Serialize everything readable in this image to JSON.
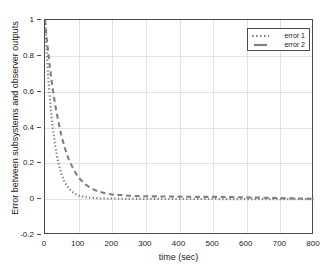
{
  "chart_data": {
    "type": "line",
    "title": "",
    "xlabel": "time (sec)",
    "ylabel": "Error between subsystems and observer outputs",
    "xlim": [
      0,
      800
    ],
    "ylim": [
      -0.2,
      1.0
    ],
    "xticks": [
      0,
      100,
      200,
      300,
      400,
      500,
      600,
      700,
      800
    ],
    "yticks": [
      -0.2,
      0,
      0.2,
      0.4,
      0.6,
      0.8,
      1
    ],
    "xticklabels": [
      "0",
      "100",
      "200",
      "300",
      "400",
      "500",
      "600",
      "700",
      "800"
    ],
    "yticklabels": [
      "-0.2",
      "0",
      "0.2",
      "0.4",
      "0.6",
      "0.8",
      "1"
    ],
    "grid": true,
    "legend_position": "upper right",
    "series": [
      {
        "name": "error 1",
        "linestyle": "dotted",
        "color": "#808080",
        "x": [
          0,
          5,
          10,
          15,
          20,
          25,
          30,
          35,
          40,
          50,
          60,
          70,
          80,
          90,
          100,
          120,
          140,
          160,
          180,
          200,
          250,
          300,
          350,
          400,
          450,
          500,
          550,
          600,
          650,
          700,
          750,
          800
        ],
        "y": [
          1.0,
          0.82,
          0.67,
          0.55,
          0.45,
          0.37,
          0.3,
          0.25,
          0.2,
          0.135,
          0.09,
          0.062,
          0.042,
          0.029,
          0.02,
          0.011,
          0.007,
          0.005,
          0.004,
          0.003,
          0.002,
          0.002,
          0.001,
          0.001,
          0.001,
          0.001,
          0.0,
          0.0,
          0.0,
          0.0,
          0.0,
          0.0
        ]
      },
      {
        "name": "error 2",
        "linestyle": "dashed",
        "color": "#808080",
        "x": [
          0,
          5,
          10,
          15,
          20,
          25,
          30,
          40,
          50,
          60,
          70,
          80,
          90,
          100,
          120,
          140,
          160,
          180,
          200,
          250,
          300,
          350,
          400,
          450,
          500,
          550,
          600,
          650,
          700,
          750,
          800
        ],
        "y": [
          1.0,
          0.9,
          0.81,
          0.73,
          0.655,
          0.59,
          0.53,
          0.43,
          0.345,
          0.28,
          0.225,
          0.185,
          0.15,
          0.12,
          0.082,
          0.058,
          0.042,
          0.032,
          0.026,
          0.019,
          0.016,
          0.015,
          0.014,
          0.013,
          0.013,
          0.012,
          0.01,
          0.008,
          0.006,
          0.004,
          0.002
        ]
      }
    ]
  },
  "legend": {
    "entries": [
      {
        "label": "error 1"
      },
      {
        "label": "error 2"
      }
    ]
  },
  "colors": {
    "curve": "#808080",
    "axis": "#4d4d4d",
    "grid": "#e2e2e2",
    "text": "#1a1a1a"
  }
}
